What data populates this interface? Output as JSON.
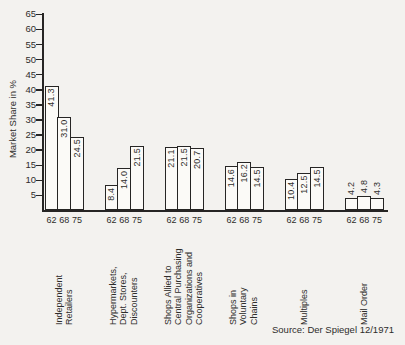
{
  "chart_data": {
    "type": "bar",
    "title": "",
    "ylabel": "Market Share in %",
    "xlabel": "",
    "ylim": [
      0,
      65
    ],
    "yticks": [
      65,
      60,
      55,
      50,
      45,
      40,
      35,
      30,
      25,
      20,
      15,
      10,
      5
    ],
    "grid": false,
    "legend": false,
    "years": [
      "62",
      "68",
      "75"
    ],
    "groups": [
      {
        "label": "Independent\nRetailers",
        "values": [
          41.3,
          31.0,
          24.5
        ],
        "value_labels": [
          "41.3",
          "31.0",
          "24.5"
        ],
        "labels_above": false
      },
      {
        "label": "Hypermarkets,\nDept. Stores,\nDiscounters",
        "values": [
          8.4,
          14.0,
          21.5
        ],
        "value_labels": [
          "8.4",
          "14.0",
          "21.5"
        ],
        "labels_above": false
      },
      {
        "label": "Shops Allied to\nCentral Purchasing\nOrganizations and\nCooperatives",
        "values": [
          21.1,
          21.5,
          20.7
        ],
        "value_labels": [
          "21.1",
          "21.5",
          "20.7"
        ],
        "labels_above": false
      },
      {
        "label": "Shops in\nVoluntary\nChains",
        "values": [
          14.6,
          16.2,
          14.5
        ],
        "value_labels": [
          "14.6",
          "16.2",
          "14.5"
        ],
        "labels_above": false
      },
      {
        "label": "Multiples",
        "values": [
          10.4,
          12.5,
          14.5
        ],
        "value_labels": [
          "10.4",
          "12.5",
          "14.5"
        ],
        "labels_above": false
      },
      {
        "label": "Mail Order",
        "values": [
          4.2,
          4.8,
          4.3
        ],
        "value_labels": [
          "4.2",
          "4.8",
          "4.3"
        ],
        "labels_above": true
      }
    ],
    "source": "Source: Der Spiegel 12/1971",
    "colors": {
      "background": "#f3f2ef",
      "bar_fill": "#fbfaf7",
      "line": "#262524",
      "text": "#2e2d2b"
    }
  }
}
